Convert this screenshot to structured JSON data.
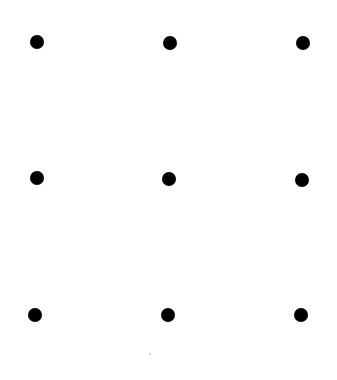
{
  "diagram": {
    "title": "",
    "type": "3x3 dot grid",
    "background": "#ffffff",
    "dot_color": "#000000",
    "dot_radius": 7,
    "dots": [
      {
        "row": 1,
        "col": 1,
        "x": 37,
        "y": 42
      },
      {
        "row": 1,
        "col": 2,
        "x": 170,
        "y": 43
      },
      {
        "row": 1,
        "col": 3,
        "x": 303,
        "y": 43
      },
      {
        "row": 2,
        "col": 1,
        "x": 37,
        "y": 178
      },
      {
        "row": 2,
        "col": 2,
        "x": 169,
        "y": 179
      },
      {
        "row": 2,
        "col": 3,
        "x": 302,
        "y": 180
      },
      {
        "row": 3,
        "col": 1,
        "x": 35,
        "y": 315
      },
      {
        "row": 3,
        "col": 2,
        "x": 168,
        "y": 315
      },
      {
        "row": 3,
        "col": 3,
        "x": 301,
        "y": 315
      }
    ],
    "speck": {
      "x": 150,
      "y": 354,
      "color": "#cccccc"
    }
  }
}
